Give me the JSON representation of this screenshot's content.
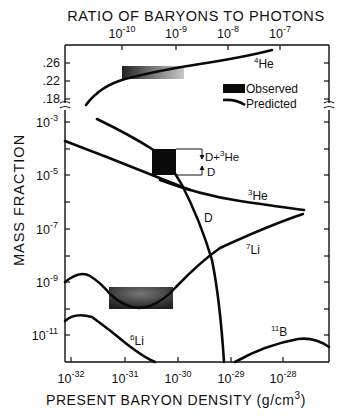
{
  "chart_data": {
    "type": "line",
    "top_axis": {
      "label": "RATIO OF BARYONS TO PHOTONS",
      "ticks": [
        {
          "base": "10",
          "exp": "-10",
          "x": 122
        },
        {
          "base": "10",
          "exp": "-9",
          "x": 176
        },
        {
          "base": "10",
          "exp": "-8",
          "x": 228
        },
        {
          "base": "10",
          "exp": "-7",
          "x": 280
        }
      ]
    },
    "xlabel": "PRESENT BARYON DENSITY (g/cm³)",
    "xlabel_main": "PRESENT BARYON DENSITY (g/cm",
    "xlabel_sup": "3",
    "xlabel_end": ")",
    "x_ticks": [
      {
        "base": "10",
        "exp": "-32",
        "x": 71
      },
      {
        "base": "10",
        "exp": "-31",
        "x": 125
      },
      {
        "base": "10",
        "exp": "-30",
        "x": 178
      },
      {
        "base": "10",
        "exp": "-29",
        "x": 231
      },
      {
        "base": "10",
        "exp": "-28",
        "x": 283
      }
    ],
    "xlim": [
      "1e-32",
      "1.2e-28"
    ],
    "ylabel": "MASS FRACTION",
    "y_upper_ticks": [
      {
        "label": ".26",
        "y": 63
      },
      {
        "label": ".22",
        "y": 81
      },
      {
        "label": ".18",
        "y": 99
      }
    ],
    "y_log_ticks": [
      {
        "base": "10",
        "exp": "-3",
        "y": 122
      },
      {
        "base": "10",
        "exp": "-5",
        "y": 175
      },
      {
        "base": "10",
        "exp": "-7",
        "y": 229
      },
      {
        "base": "10",
        "exp": "-9",
        "y": 282
      },
      {
        "base": "10",
        "exp": "-11",
        "y": 335
      }
    ],
    "y_minor_ticks_y": [
      149,
      202,
      256,
      309
    ],
    "ylim_log": [
      "1e-12",
      "1e-3"
    ],
    "legend": [
      {
        "label": "Observed",
        "kind": "box"
      },
      {
        "label": "Predicted",
        "kind": "line"
      }
    ],
    "series": [
      {
        "name": "4He",
        "label_base": "He",
        "label_sup": "4",
        "points": [
          [
            1e-32,
            0.175
          ],
          [
            3e-32,
            0.2
          ],
          [
            1e-31,
            0.22
          ],
          [
            1e-30,
            0.24
          ],
          [
            1e-29,
            0.255
          ],
          [
            1e-28,
            0.265
          ]
        ]
      },
      {
        "name": "D+3He upper",
        "label_base": "",
        "label_sup": "",
        "points": [
          [
            2.5e-32,
            0.0002
          ],
          [
            1e-31,
            5e-05
          ],
          [
            3e-31,
            1.5e-05
          ],
          [
            7e-31,
            4e-06
          ],
          [
            1.5e-30,
            4e-07
          ],
          [
            3e-30,
            3e-08
          ],
          [
            6e-30,
            5e-10
          ],
          [
            9e-30,
            1e-12
          ]
        ]
      },
      {
        "name": "D",
        "label_base": "D",
        "label_sup": "",
        "points": [
          [
            1e-32,
            4e-05
          ],
          [
            1e-31,
            8e-06
          ],
          [
            3e-31,
            2e-06
          ]
        ]
      },
      {
        "name": "3He",
        "label_base": "He",
        "label_sup": "3",
        "points": [
          [
            3e-31,
            2e-06
          ],
          [
            1e-30,
            8e-07
          ],
          [
            1e-29,
            3e-07
          ],
          [
            8e-29,
            2e-07
          ]
        ]
      },
      {
        "name": "7Li",
        "label_base": "Li",
        "label_sup": "7",
        "points": [
          [
            1e-32,
            2e-09
          ],
          [
            2e-32,
            3e-09
          ],
          [
            4e-32,
            2e-09
          ],
          [
            1e-31,
            2e-10
          ],
          [
            3e-31,
            1e-10
          ],
          [
            6e-31,
            3e-10
          ],
          [
            1e-30,
            1.5e-09
          ],
          [
            3e-30,
            1e-08
          ],
          [
            1e-29,
            5e-08
          ],
          [
            8e-29,
            1.7e-07
          ]
        ]
      },
      {
        "name": "6Li",
        "label_base": "Li",
        "label_sup": "6",
        "points": [
          [
            1e-32,
            2e-11
          ],
          [
            2e-32,
            3e-11
          ],
          [
            4e-32,
            2e-11
          ],
          [
            1e-31,
            5e-12
          ],
          [
            2.5e-31,
            1e-12
          ]
        ]
      },
      {
        "name": "11B",
        "label_base": "B",
        "label_sup": "11",
        "points": [
          [
            1.3e-29,
            1e-12
          ],
          [
            3e-29,
            5e-12
          ],
          [
            8e-29,
            1.5e-11
          ],
          [
            1.5e-28,
            1.6e-11
          ],
          [
            2.5e-28,
            1e-11
          ]
        ]
      }
    ],
    "observed_boxes": [
      {
        "name": "4He observed",
        "x_range": [
          "1e-31",
          "4e-31"
        ],
        "y_range": [
          0.22,
          0.245
        ]
      },
      {
        "name": "D and D+3He observed",
        "x_range": [
          "5e-31",
          "9e-31"
        ],
        "y_range": [
          "1e-5",
          "8e-5"
        ]
      },
      {
        "name": "7Li observed",
        "x_range": [
          "6e-32",
          "7e-31"
        ],
        "y_range": [
          "1e-10",
          "3e-10"
        ]
      }
    ],
    "annotations": [
      {
        "text": "D+³He",
        "base": "D+",
        "sup": "3",
        "end": "He"
      },
      {
        "text": "D"
      }
    ],
    "grid": false
  },
  "labels": {
    "he4": {
      "sup": "4",
      "base": "He"
    },
    "he3": {
      "sup": "3",
      "base": "He"
    },
    "li7": {
      "sup": "7",
      "base": "Li"
    },
    "li6": {
      "sup": "6",
      "base": "Li"
    },
    "b11": {
      "sup": "11",
      "base": "B"
    },
    "d_curve": "D",
    "ann_dhe_base": "D+",
    "ann_dhe_sup": "3",
    "ann_dhe_end": "He",
    "ann_d": "D",
    "legend_observed": "Observed",
    "legend_predicted": "Predicted",
    "top_title": "RATIO OF BARYONS TO PHOTONS",
    "ylabel": "MASS FRACTION"
  }
}
